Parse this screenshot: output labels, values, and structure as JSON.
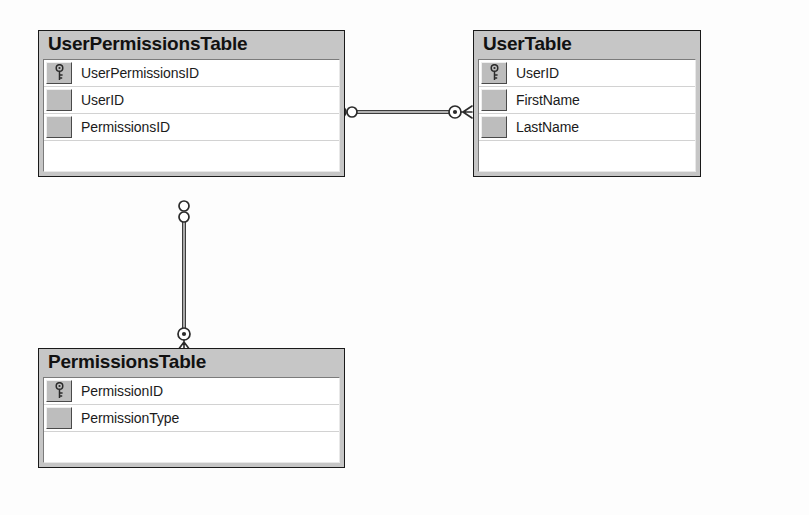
{
  "diagram": {
    "notation": "crows-foot",
    "background_color": "#fdfdfd",
    "entity_header_color": "#c6c6c6",
    "entity_border_color": "#1a1a1a",
    "gutter_color": "#bdbdbd",
    "row_background_color": "#ffffff",
    "line_color": "#3c3c3c"
  },
  "entities": [
    {
      "id": "userpermissions",
      "name": "UserPermissionsTable",
      "attributes": [
        {
          "name": "UserPermissionsID",
          "key": true
        },
        {
          "name": "UserID",
          "key": false
        },
        {
          "name": "PermissionsID",
          "key": false
        }
      ],
      "blank_row": true
    },
    {
      "id": "user",
      "name": "UserTable",
      "attributes": [
        {
          "name": "UserID",
          "key": true
        },
        {
          "name": "FirstName",
          "key": false
        },
        {
          "name": "LastName",
          "key": false
        }
      ],
      "blank_row": true
    },
    {
      "id": "permissions",
      "name": "PermissionsTable",
      "attributes": [
        {
          "name": "PermissionID",
          "key": true
        },
        {
          "name": "PermissionType",
          "key": false
        }
      ],
      "blank_row": true
    }
  ],
  "relationships": [
    {
      "id": "rel-userpermissions-user",
      "from_entity": "userpermissions",
      "to_entity": "user",
      "from_cardinality": "zero-or-more",
      "to_cardinality": "one-or-more",
      "orientation": "horizontal"
    },
    {
      "id": "rel-userpermissions-permissions",
      "from_entity": "userpermissions",
      "to_entity": "permissions",
      "from_cardinality": "zero-or-more",
      "to_cardinality": "one-or-more",
      "orientation": "vertical"
    }
  ],
  "icons": {
    "primary_key": "key-icon"
  }
}
